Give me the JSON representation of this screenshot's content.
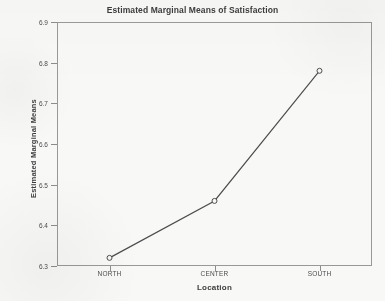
{
  "chart_data": {
    "type": "line",
    "title": "Estimated Marginal Means of Satisfaction",
    "xlabel": "Location",
    "ylabel": "Estimated Marginal Means",
    "categories": [
      "NORTH",
      "CENTER",
      "SOUTH"
    ],
    "values": [
      6.32,
      6.46,
      6.78
    ],
    "series": [
      {
        "name": "Estimated Marginal Means",
        "values": [
          6.32,
          6.46,
          6.78
        ]
      }
    ],
    "ylim": [
      6.3,
      6.9
    ],
    "y_ticks": [
      6.9,
      6.8,
      6.7,
      6.6,
      6.5,
      6.4,
      6.3
    ],
    "y_tick_labels": [
      "6.9",
      "6.8",
      "6.7",
      "6.6",
      "6.5",
      "6.4",
      "6.3"
    ],
    "grid": false,
    "legend": false,
    "legend_position": "none",
    "marker": "open-circle",
    "line_color": "#4a4a4a",
    "marker_color": "#4a4a4a",
    "frame_color": "#9a9a9a"
  },
  "plot": {
    "title": "Estimated Marginal Means of Satisfaction",
    "x_axis_title": "Location",
    "y_axis_title": "Estimated Marginal Means"
  }
}
